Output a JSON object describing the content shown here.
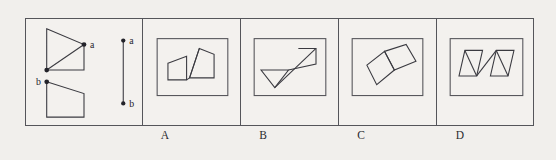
{
  "figure": {
    "type": "spatial-reasoning-multiple-choice",
    "background_color": "#f1efec",
    "stroke_color": "#3a3a40",
    "frame": {
      "x": 25,
      "y": 18,
      "width": 509,
      "height": 108,
      "border_color": "#55555a"
    },
    "question_panel": {
      "name": "question-panel",
      "labels": {
        "point_a_upper": "a",
        "point_b_lower": "b",
        "segment_a": "a",
        "segment_b": "b"
      },
      "shapes": [
        {
          "name": "upper-right-triangle-with-vertical-edge",
          "polyline": [
            [
              20,
              10
            ],
            [
              58,
              26
            ],
            [
              58,
              52
            ],
            [
              20,
              52
            ]
          ],
          "closed": false,
          "extra_edges": [
            [
              [
                20,
                10
              ],
              [
                20,
                52
              ]
            ],
            [
              [
                20,
                52
              ],
              [
                58,
                26
              ]
            ]
          ],
          "marked_points": [
            {
              "label": "a",
              "x": 58,
              "y": 26
            },
            {
              "label": "",
              "x": 20,
              "y": 52
            }
          ]
        },
        {
          "name": "lower-quadrilateral",
          "polygon": [
            [
              20,
              64
            ],
            [
              58,
              76
            ],
            [
              58,
              100
            ],
            [
              20,
              100
            ]
          ],
          "marked_points": [
            {
              "label": "b",
              "x": 20,
              "y": 64
            }
          ]
        },
        {
          "name": "reference-segment-ab",
          "segment": [
            [
              98,
              22
            ],
            [
              98,
              86
            ]
          ],
          "endpoints": [
            {
              "label": "a",
              "x": 98,
              "y": 22
            },
            {
              "label": "b",
              "x": 98,
              "y": 86
            }
          ]
        }
      ]
    },
    "options": [
      {
        "id": "A",
        "label": "A",
        "name": "option-a",
        "inner_box": {
          "x": 14,
          "y": 20,
          "width": 72,
          "height": 58
        },
        "shapes": [
          {
            "name": "left-quadrilateral",
            "polygon": [
              [
                25,
                45
              ],
              [
                44,
                38
              ],
              [
                44,
                62
              ],
              [
                25,
                62
              ]
            ]
          },
          {
            "name": "right-triangle-quad",
            "polygon": [
              [
                57,
                30
              ],
              [
                72,
                36
              ],
              [
                72,
                60
              ],
              [
                47,
                60
              ]
            ],
            "diagonal": [
              [
                47,
                60
              ],
              [
                57,
                30
              ]
            ]
          },
          {
            "name": "connector-line",
            "segment": [
              [
                44,
                62
              ],
              [
                47,
                60
              ]
            ]
          }
        ]
      },
      {
        "id": "B",
        "label": "B",
        "name": "option-b",
        "inner_box": {
          "x": 14,
          "y": 20,
          "width": 72,
          "height": 58
        },
        "shapes": [
          {
            "name": "lower-left-inverted-triangle",
            "polygon": [
              [
                20,
                52
              ],
              [
                48,
                52
              ],
              [
                34,
                70
              ]
            ]
          },
          {
            "name": "upper-right-quad",
            "polygon": [
              [
                58,
                30
              ],
              [
                76,
                30
              ],
              [
                76,
                46
              ],
              [
                48,
                52
              ]
            ]
          },
          {
            "name": "diagonal-connector",
            "segment": [
              [
                34,
                70
              ],
              [
                76,
                30
              ]
            ]
          }
        ]
      },
      {
        "id": "C",
        "label": "C",
        "name": "option-c",
        "inner_box": {
          "x": 14,
          "y": 20,
          "width": 72,
          "height": 58
        },
        "shapes": [
          {
            "name": "upper-right-tilted-parallelogram",
            "polygon": [
              [
                46,
                33
              ],
              [
                68,
                26
              ],
              [
                78,
                43
              ],
              [
                56,
                52
              ]
            ]
          },
          {
            "name": "lower-left-tilted-parallelogram",
            "polygon": [
              [
                28,
                47
              ],
              [
                46,
                33
              ],
              [
                56,
                52
              ],
              [
                38,
                67
              ]
            ]
          }
        ]
      },
      {
        "id": "D",
        "label": "D",
        "name": "option-d",
        "inner_box": {
          "x": 14,
          "y": 20,
          "width": 74,
          "height": 58
        },
        "shapes": [
          {
            "name": "left-parallelogram",
            "polygon": [
              [
                28,
                32
              ],
              [
                46,
                32
              ],
              [
                40,
                58
              ],
              [
                22,
                58
              ]
            ],
            "diagonal": [
              [
                28,
                32
              ],
              [
                40,
                58
              ]
            ]
          },
          {
            "name": "right-parallelogram",
            "polygon": [
              [
                60,
                32
              ],
              [
                78,
                32
              ],
              [
                72,
                58
              ],
              [
                54,
                58
              ]
            ],
            "diagonal": [
              [
                60,
                32
              ],
              [
                72,
                58
              ]
            ]
          },
          {
            "name": "connector-diagonal",
            "segment": [
              [
                40,
                58
              ],
              [
                60,
                32
              ]
            ]
          }
        ]
      }
    ]
  }
}
